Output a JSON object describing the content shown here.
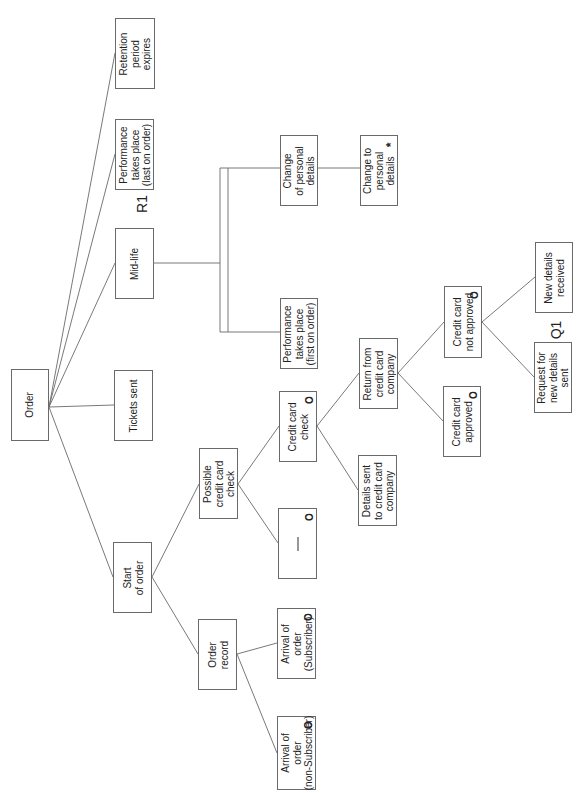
{
  "diagram": {
    "type": "entity-life-history",
    "orientation": "rotated-90-ccw",
    "root": {
      "id": "order",
      "label": "Order"
    },
    "nodes": [
      {
        "id": "order",
        "label": "Order",
        "marker": ""
      },
      {
        "id": "start_of_order",
        "label": "Start\nof order",
        "marker": ""
      },
      {
        "id": "tickets_sent",
        "label": "Tickets sent",
        "marker": ""
      },
      {
        "id": "mid_life",
        "label": "Mid-life",
        "marker": ""
      },
      {
        "id": "perf_last",
        "label": "Performance\ntakes place\n(last on order)",
        "marker": ""
      },
      {
        "id": "retention",
        "label": "Retention\nperiod\nexpires",
        "marker": ""
      },
      {
        "id": "order_record",
        "label": "Order\nrecord",
        "marker": ""
      },
      {
        "id": "possible_cc_check",
        "label": "Possible\ncredit card\ncheck",
        "marker": ""
      },
      {
        "id": "arrival_nonsub",
        "label": "Arrival of\norder\n(non-Subscriber)",
        "marker": "o"
      },
      {
        "id": "arrival_sub",
        "label": "Arrival of\norder\n(Subscriber)",
        "marker": "o"
      },
      {
        "id": "null_box",
        "label": "—",
        "marker": "o"
      },
      {
        "id": "cc_check",
        "label": "Credit card\ncheck",
        "marker": "o"
      },
      {
        "id": "details_sent",
        "label": "Details sent\nto credit card\ncompany",
        "marker": ""
      },
      {
        "id": "return_cc",
        "label": "Return from\ncredit card\ncompany",
        "marker": ""
      },
      {
        "id": "cc_approved",
        "label": "Credit card\napproved",
        "marker": "o"
      },
      {
        "id": "cc_not_approved",
        "label": "Credit card\nnot approved",
        "marker": "o"
      },
      {
        "id": "request_new",
        "label": "Request for\nnew details\nsent",
        "marker": ""
      },
      {
        "id": "new_received",
        "label": "New details\nreceived",
        "marker": ""
      },
      {
        "id": "perf_first",
        "label": "Performance\ntakes place\n(first on order)",
        "marker": ""
      },
      {
        "id": "change_of_personal",
        "label": "Change\nof personal\ndetails",
        "marker": ""
      },
      {
        "id": "change_to_personal",
        "label": "Change to\npersonal\ndetails",
        "marker": "*"
      }
    ],
    "edges": [
      [
        "order",
        "start_of_order"
      ],
      [
        "order",
        "tickets_sent"
      ],
      [
        "order",
        "mid_life"
      ],
      [
        "order",
        "perf_last"
      ],
      [
        "order",
        "retention"
      ],
      [
        "start_of_order",
        "order_record"
      ],
      [
        "start_of_order",
        "possible_cc_check"
      ],
      [
        "order_record",
        "arrival_nonsub"
      ],
      [
        "order_record",
        "arrival_sub"
      ],
      [
        "possible_cc_check",
        "null_box"
      ],
      [
        "possible_cc_check",
        "cc_check"
      ],
      [
        "cc_check",
        "details_sent"
      ],
      [
        "cc_check",
        "return_cc"
      ],
      [
        "return_cc",
        "cc_approved"
      ],
      [
        "return_cc",
        "cc_not_approved"
      ],
      [
        "cc_not_approved",
        "request_new"
      ],
      [
        "cc_not_approved",
        "new_received"
      ],
      [
        "mid_life",
        "perf_first"
      ],
      [
        "mid_life",
        "change_of_personal"
      ],
      [
        "change_of_personal",
        "change_to_personal"
      ]
    ],
    "annotations": [
      {
        "id": "r1",
        "text": "R1"
      },
      {
        "id": "q1",
        "text": "Q1"
      }
    ]
  },
  "labels": {
    "order": "Order",
    "start_of_order": "Start\nof order",
    "tickets_sent": "Tickets sent",
    "mid_life": "Mid-life",
    "perf_last": "Performance\ntakes place\n(last on order)",
    "retention": "Retention\nperiod\nexpires",
    "order_record": "Order\nrecord",
    "possible_cc_check": "Possible\ncredit card\ncheck",
    "arrival_nonsub": "Arrival of\norder\n(non-Subscriber)",
    "arrival_sub": "Arrival of\norder\n(Subscriber)",
    "cc_check": "Credit card\ncheck",
    "details_sent": "Details sent\nto credit card\ncompany",
    "return_cc": "Return from\ncredit card\ncompany",
    "cc_approved": "Credit card\napproved",
    "cc_not_approved": "Credit card\nnot approved",
    "request_new": "Request for\nnew details\nsent",
    "new_received": "New details\nreceived",
    "perf_first": "Performance\ntakes place\n(first on order)",
    "change_of_personal": "Change\nof personal\ndetails",
    "change_to_personal": "Change to\npersonal\ndetails",
    "r1": "R1",
    "q1": "Q1",
    "marker_o": "O",
    "marker_star": "*"
  }
}
